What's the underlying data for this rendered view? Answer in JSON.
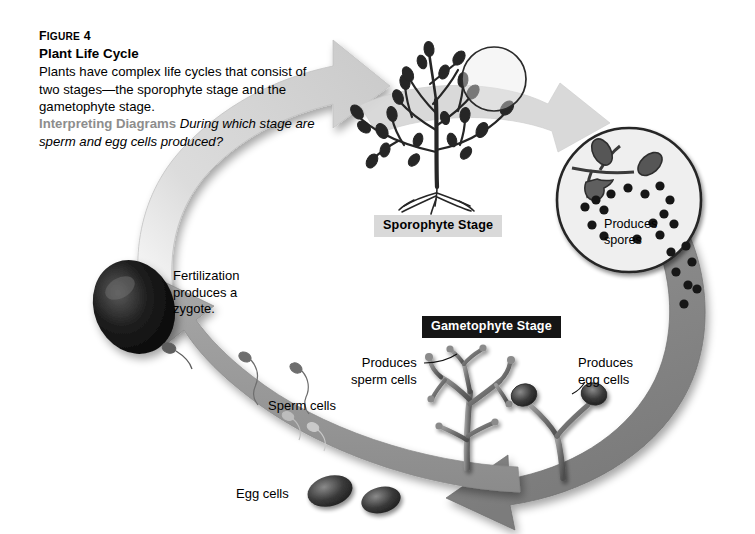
{
  "figure": {
    "number_label": "Figure 4",
    "number_label_display": "F",
    "number_label_rest": "IGURE",
    "number_value": "4",
    "title": "Plant Life Cycle",
    "body": "Plants have complex life cycles that consist of two stages—the sporophyte stage and the gametophyte stage.",
    "prompt_lead": "Interpreting Diagrams",
    "prompt_question": "During which stage are sperm and egg cells produced?"
  },
  "stage_labels": {
    "sporophyte": "Sporophyte Stage",
    "gametophyte": "Gametophyte Stage"
  },
  "callouts": {
    "fertilization": "Fertilization\nproduces a\nzygote.",
    "produces_spores": "Produces\nspores",
    "produces_sperm_cells": "Produces\nsperm cells",
    "produces_egg_cells": "Produces\negg cells",
    "sperm_cells": "Sperm cells",
    "egg_cells": "Egg cells"
  },
  "colors": {
    "background": "#ffffff",
    "text": "#000000",
    "prompt_lead": "#8d8d8d",
    "arrow_light": "#d6d6d6",
    "arrow_medium": "#9a9a9a",
    "arrow_dark": "#7d7d7d",
    "label_light_bg": "#d9d9d9",
    "label_dark_bg": "#151515",
    "plant_dark": "#2b2b2b",
    "circle_fill": "#eeeeee",
    "circle_stroke": "#2a2a2a",
    "zygote": "#101010"
  },
  "diagram": {
    "type": "cycle-diagram",
    "cycle_direction": "clockwise",
    "nodes": [
      {
        "name": "sporophyte-plant",
        "label": "Sporophyte Stage",
        "position": "top"
      },
      {
        "name": "spore-magnifier",
        "label": "Produces spores",
        "position": "right-upper"
      },
      {
        "name": "gametophyte-plants",
        "label": "Gametophyte Stage",
        "position": "bottom-right"
      },
      {
        "name": "zygote",
        "label": "Fertilization produces a zygote.",
        "position": "left"
      }
    ],
    "arrows": [
      {
        "name": "arrow-zygote-to-sporophyte",
        "shade": "light",
        "from": "zygote",
        "to": "sporophyte-plant"
      },
      {
        "name": "arrow-spores-to-gametophyte",
        "shade": "dark",
        "from": "spore-magnifier",
        "to": "gametophyte-plants"
      },
      {
        "name": "arrow-gametes-to-zygote",
        "shade": "medium",
        "from": "gametophyte-plants",
        "to": "zygote"
      }
    ]
  }
}
